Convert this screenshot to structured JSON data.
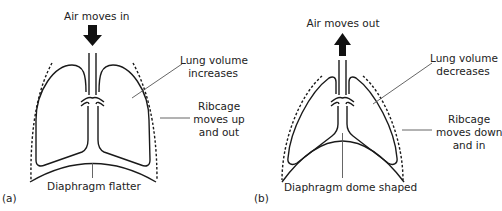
{
  "panel_a": {
    "tag": "(a)",
    "air_label": "Air moves in",
    "air_direction": "down",
    "lung_label_line1": "Lung volume",
    "lung_label_line2": "increases",
    "ribcage_label_line1": "Ribcage",
    "ribcage_label_line2": "moves up",
    "ribcage_label_line3": "and out",
    "diaphragm_label": "Diaphragm flatter"
  },
  "panel_b": {
    "tag": "(b)",
    "air_label": "Air moves out",
    "air_direction": "up",
    "lung_label_line1": "Lung volume",
    "lung_label_line2": "decreases",
    "ribcage_label_line1": "Ribcage",
    "ribcage_label_line2": "moves down",
    "ribcage_label_line3": "and in",
    "diaphragm_label": "Diaphragm dome shaped"
  },
  "colors": {
    "stroke": "#1a1a1a",
    "leader": "#555555",
    "arrow": "#111111"
  }
}
